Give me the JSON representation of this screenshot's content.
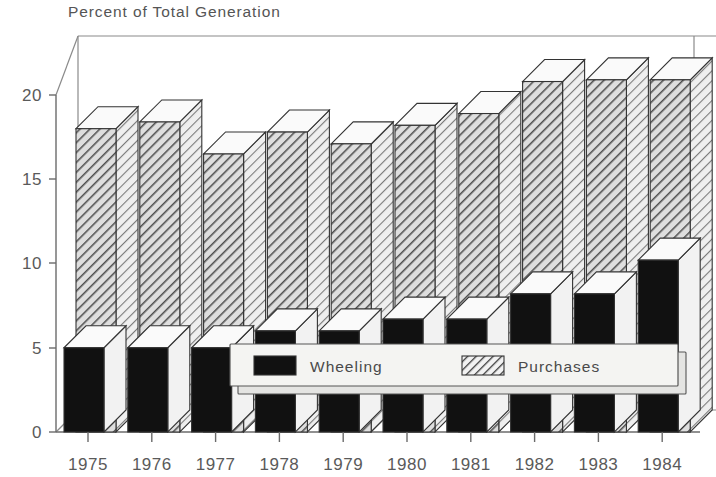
{
  "chart_data": {
    "type": "bar",
    "title": "Percent of Total Generation",
    "subtitle": "",
    "xlabel": "",
    "ylabel": "",
    "categories": [
      "1975",
      "1976",
      "1977",
      "1978",
      "1979",
      "1980",
      "1981",
      "1982",
      "1983",
      "1984"
    ],
    "series": [
      {
        "name": "Wheeling",
        "fill": "solid-black",
        "color": "#111111",
        "values": [
          5.0,
          5.0,
          5.0,
          6.0,
          6.0,
          6.7,
          6.7,
          8.2,
          8.2,
          10.2
        ]
      },
      {
        "name": "Purchases",
        "fill": "diagonal-hatch",
        "color": "#cfcfcf",
        "values": [
          18.0,
          18.4,
          16.5,
          17.8,
          17.1,
          18.2,
          18.9,
          20.8,
          20.9,
          20.9
        ]
      }
    ],
    "ylim": [
      0,
      22.5
    ],
    "yticks": [
      0,
      5,
      10,
      15,
      20
    ],
    "ytick_labels": [
      "0",
      "5",
      "10",
      "15",
      "20"
    ],
    "grid": false,
    "legend_position": "inside-bottom-center",
    "style": "3d-isometric-bars",
    "annotations": []
  },
  "legend": {
    "items": [
      {
        "label": "Wheeling",
        "swatch": "solid-black-swatch"
      },
      {
        "label": "Purchases",
        "swatch": "hatched-swatch"
      }
    ]
  },
  "colors": {
    "background": "#ffffff",
    "axis": "#6b6b6b",
    "text": "#4a4a4a",
    "wheeling": "#111111",
    "purchases_hatch": "#555555",
    "purchases_field": "#d8d8d8",
    "bar_top": "#f7f7f7",
    "bar_side": "#fbfbfb"
  }
}
